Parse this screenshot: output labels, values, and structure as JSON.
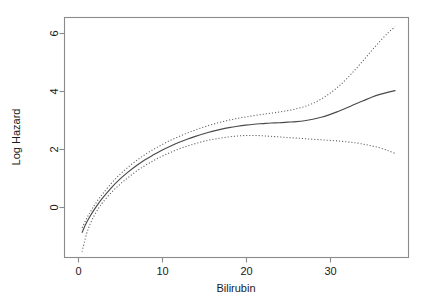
{
  "chart_data": {
    "type": "line",
    "title": "",
    "xlabel": "Bilirubin",
    "ylabel": "Log Hazard",
    "xlim": [
      -1.6,
      39.4
    ],
    "ylim": [
      -1.75,
      6.55
    ],
    "xticks": [
      0,
      10,
      20,
      30
    ],
    "xtick_labels": [
      "0",
      "10",
      "20",
      "30"
    ],
    "yticks": [
      0,
      2,
      4,
      6
    ],
    "ytick_labels": [
      "0",
      "2",
      "4",
      "6"
    ],
    "grid": false,
    "legend": "none",
    "box": true,
    "series": [
      {
        "name": "upper confidence band",
        "style": "dotted",
        "x": [
          0.5,
          1.0,
          1.5,
          2.0,
          2.5,
          3.0,
          4.0,
          5.0,
          6.0,
          7.0,
          8.0,
          9.0,
          10.0,
          11.0,
          12.0,
          13.0,
          14.0,
          15.0,
          16.0,
          17.0,
          18.0,
          19.0,
          20.0,
          21.0,
          22.0,
          23.0,
          24.0,
          25.0,
          26.0,
          27.0,
          28.0,
          29.0,
          30.0,
          31.0,
          32.0,
          33.0,
          34.0,
          35.0,
          36.0,
          37.0,
          37.8
        ],
        "y": [
          -0.72,
          -0.42,
          -0.16,
          0.07,
          0.28,
          0.47,
          0.82,
          1.12,
          1.38,
          1.61,
          1.81,
          1.99,
          2.15,
          2.3,
          2.43,
          2.55,
          2.66,
          2.76,
          2.85,
          2.93,
          3.0,
          3.06,
          3.11,
          3.16,
          3.2,
          3.24,
          3.28,
          3.33,
          3.39,
          3.47,
          3.58,
          3.73,
          3.92,
          4.15,
          4.42,
          4.73,
          5.06,
          5.4,
          5.73,
          6.03,
          6.23
        ]
      },
      {
        "name": "fitted log hazard",
        "style": "solid",
        "x": [
          0.5,
          1.0,
          1.5,
          2.0,
          2.5,
          3.0,
          4.0,
          5.0,
          6.0,
          7.0,
          8.0,
          9.0,
          10.0,
          11.0,
          12.0,
          13.0,
          14.0,
          15.0,
          16.0,
          17.0,
          18.0,
          19.0,
          20.0,
          21.0,
          22.0,
          23.0,
          24.0,
          25.0,
          26.0,
          27.0,
          28.0,
          29.0,
          30.0,
          31.0,
          32.0,
          33.0,
          34.0,
          35.0,
          36.0,
          37.0,
          37.8
        ],
        "y": [
          -0.88,
          -0.56,
          -0.3,
          -0.07,
          0.14,
          0.33,
          0.67,
          0.96,
          1.21,
          1.43,
          1.63,
          1.8,
          1.96,
          2.1,
          2.23,
          2.34,
          2.44,
          2.53,
          2.61,
          2.68,
          2.74,
          2.79,
          2.83,
          2.86,
          2.88,
          2.9,
          2.91,
          2.93,
          2.95,
          2.98,
          3.03,
          3.1,
          3.19,
          3.3,
          3.42,
          3.55,
          3.67,
          3.79,
          3.89,
          3.97,
          4.02
        ]
      },
      {
        "name": "lower confidence band",
        "style": "dotted",
        "x": [
          0.5,
          1.0,
          1.5,
          2.0,
          2.5,
          3.0,
          4.0,
          5.0,
          6.0,
          7.0,
          8.0,
          9.0,
          10.0,
          11.0,
          12.0,
          13.0,
          14.0,
          15.0,
          16.0,
          17.0,
          18.0,
          19.0,
          20.0,
          21.0,
          22.0,
          23.0,
          24.0,
          25.0,
          26.0,
          27.0,
          28.0,
          29.0,
          30.0,
          31.0,
          32.0,
          33.0,
          34.0,
          35.0,
          36.0,
          37.0,
          37.8
        ],
        "y": [
          -1.55,
          -0.96,
          -0.56,
          -0.27,
          -0.03,
          0.17,
          0.5,
          0.78,
          1.02,
          1.24,
          1.43,
          1.6,
          1.75,
          1.88,
          2.0,
          2.1,
          2.19,
          2.27,
          2.33,
          2.38,
          2.42,
          2.45,
          2.47,
          2.47,
          2.46,
          2.44,
          2.42,
          2.4,
          2.38,
          2.36,
          2.34,
          2.32,
          2.3,
          2.28,
          2.25,
          2.22,
          2.17,
          2.11,
          2.04,
          1.94,
          1.85
        ]
      }
    ]
  },
  "colors": {
    "axis": "#8a8a8a",
    "fit_line": "#4a4a4a",
    "band_line": "#5a5a5a",
    "text": "#1a1a1a",
    "background": "#ffffff"
  }
}
